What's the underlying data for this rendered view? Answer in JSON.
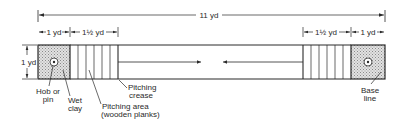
{
  "diagram": {
    "type": "court-layout",
    "colors": {
      "ink": "#2a2a2a",
      "clay_fill": "#d8d8d8",
      "background": "#ffffff"
    },
    "dimensions": {
      "overall": "11 yd",
      "left_clay": "1 yd",
      "left_pitching": "1½ yd",
      "right_pitching": "1½ yd",
      "right_clay": "1 yd",
      "width": "1 yd"
    },
    "labels": {
      "hob_pin_line1": "Hob or",
      "hob_pin_line2": "pin",
      "wet_clay_line1": "Wet",
      "wet_clay_line2": "clay",
      "pitching_area_line1": "Pitching area",
      "pitching_area_line2": "(wooden planks)",
      "pitching_crease_line1": "Pitching",
      "pitching_crease_line2": "crease",
      "base_line_line1": "Base",
      "base_line_line2": "line"
    }
  }
}
